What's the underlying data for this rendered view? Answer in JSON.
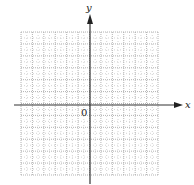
{
  "figure": {
    "type": "coordinate-grid",
    "x_axis_label": "x",
    "y_axis_label": "y",
    "origin_label": "0",
    "grid": {
      "columns": 12,
      "rows": 12,
      "columns_left_of_y_axis": 6,
      "rows_above_x_axis": 6,
      "line_style": "dotted",
      "minor_subdivisions": 2
    },
    "colors": {
      "axis": "#333333",
      "grid": "#a0a0a0",
      "background": "#ffffff"
    }
  }
}
